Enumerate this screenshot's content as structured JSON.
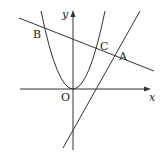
{
  "diagram": {
    "type": "coordinate-geometry",
    "axes": {
      "x_label": "x",
      "y_label": "y",
      "origin_label": "O"
    },
    "curves": [
      {
        "name": "parabola",
        "kind": "parabola",
        "vertex": "O"
      },
      {
        "name": "line-BA",
        "kind": "line",
        "through": [
          "B",
          "C",
          "A"
        ]
      },
      {
        "name": "line-steep",
        "kind": "line",
        "through": [
          "A"
        ]
      }
    ],
    "points": [
      {
        "label": "B"
      },
      {
        "label": "C"
      },
      {
        "label": "A"
      },
      {
        "label": "O"
      }
    ],
    "colors": {
      "stroke": "#333333",
      "background": "#ffffff"
    }
  }
}
